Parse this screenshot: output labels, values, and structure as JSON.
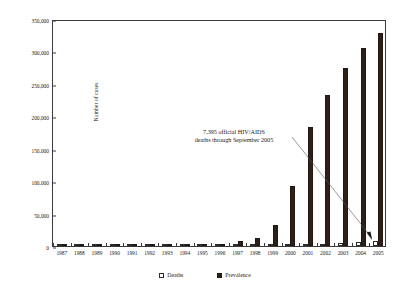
{
  "chart_data": {
    "type": "bar",
    "title": "",
    "xlabel": "",
    "ylabel": "Number of cases",
    "ylim": [
      0,
      350000
    ],
    "ytick_step": 50000,
    "yticks": [
      0,
      50000,
      100000,
      150000,
      200000,
      250000,
      300000,
      350000
    ],
    "ytick_labels": [
      "0",
      "50,000",
      "100,000",
      "150,000",
      "200,000",
      "250,000",
      "300,000",
      "350,000"
    ],
    "grid": false,
    "legend_position": "bottom",
    "categories": [
      "1987",
      "1988",
      "1989",
      "1990",
      "1991",
      "1992",
      "1993",
      "1994",
      "1995",
      "1996",
      "1997",
      "1998",
      "1999",
      "2000",
      "2001",
      "2002",
      "2003",
      "2004",
      "2005"
    ],
    "series": [
      {
        "name": "Deaths",
        "color": "#ffffff",
        "edge_color": "#2b2b2b",
        "values": [
          0,
          0,
          0,
          0,
          0,
          0,
          0,
          0,
          100,
          200,
          400,
          700,
          1100,
          1800,
          2600,
          3300,
          4300,
          6000,
          7395
        ]
      },
      {
        "name": "Prevalence",
        "color": "#2e1f17",
        "edge_color": "#241610",
        "values": [
          100,
          200,
          400,
          600,
          800,
          1000,
          1300,
          1800,
          2300,
          3600,
          8200,
          13000,
          33000,
          93000,
          183000,
          233000,
          275000,
          305000,
          328000
        ]
      }
    ],
    "annotations": [
      {
        "name": "deaths-callout",
        "line1": "7,395 official HIV/AIDS",
        "line2": "deaths through September 2005",
        "points_to": "2005 Deaths bar"
      }
    ]
  },
  "legend": {
    "items": [
      {
        "label": "Deaths",
        "swatch": "open-square-icon"
      },
      {
        "label": "Prevalence",
        "swatch": "filled-square-icon"
      }
    ]
  },
  "axes": {
    "y_title": "Number of cases"
  }
}
